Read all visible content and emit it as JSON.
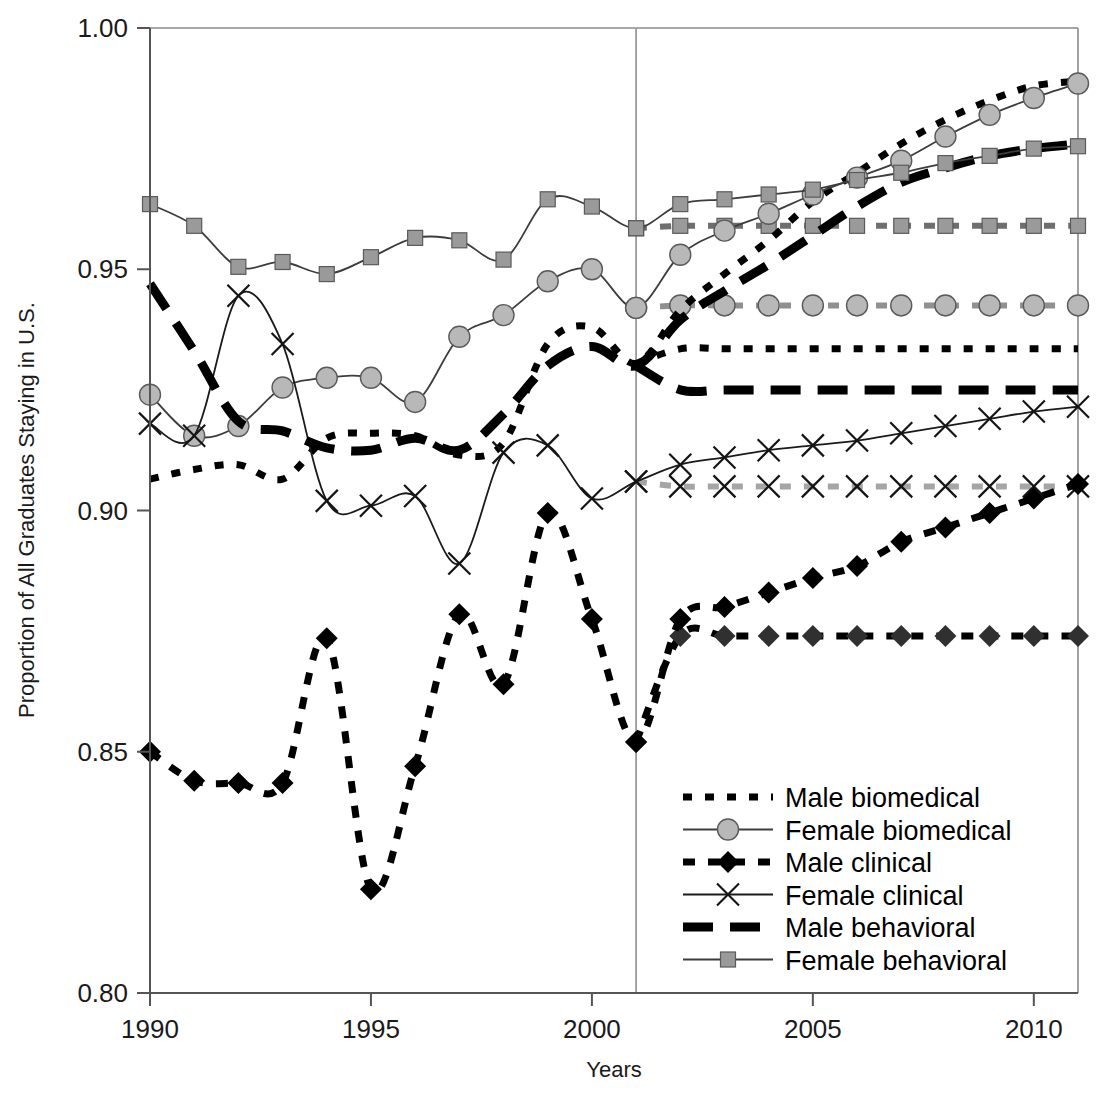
{
  "chart_data": {
    "type": "line",
    "title": "",
    "xlabel": "Years",
    "ylabel": "Proportion of All Graduates Staying in U.S.",
    "xlim": [
      1990,
      2011
    ],
    "ylim": [
      0.8,
      1.0
    ],
    "grid": false,
    "legend_position": "inside-bottom-right",
    "x_ticks": [
      1990,
      1995,
      2000,
      2005,
      2010
    ],
    "x_tick_labels": [
      "1990",
      "1995",
      "2000",
      "2005",
      "2010"
    ],
    "y_ticks": [
      0.8,
      0.85,
      0.9,
      0.95,
      1.0
    ],
    "y_tick_labels": [
      "0.80",
      "0.85",
      "0.90",
      "0.95",
      "1.00"
    ],
    "annotations": [
      {
        "type": "vertical-reference-line",
        "x": 2001,
        "label": ""
      }
    ],
    "x": [
      1990,
      1991,
      1992,
      1993,
      1994,
      1995,
      1996,
      1997,
      1998,
      1999,
      2000,
      2001,
      2002,
      2003,
      2004,
      2005,
      2006,
      2007,
      2008,
      2009,
      2010,
      2011
    ],
    "series": [
      {
        "name": "Male biomedical",
        "style": "dotted-thick-black",
        "color": "#000000",
        "marker": "none",
        "values": [
          0.9065,
          0.9085,
          0.9095,
          0.9065,
          0.915,
          0.916,
          0.9155,
          0.9115,
          0.914,
          0.9345,
          0.938,
          0.9305,
          0.9415,
          0.949,
          0.956,
          0.964,
          0.97,
          0.976,
          0.981,
          0.985,
          0.988,
          0.989
        ]
      },
      {
        "name": "Male biomedical (projected flat)",
        "style": "dotted-thick-black",
        "color": "#000000",
        "marker": "none",
        "is_projection_flat": true,
        "values": [
          null,
          null,
          null,
          null,
          null,
          null,
          null,
          null,
          null,
          null,
          null,
          0.9305,
          0.9335,
          0.9335,
          0.9335,
          0.9335,
          0.9335,
          0.9335,
          0.9335,
          0.9335,
          0.9335,
          0.9335
        ]
      },
      {
        "name": "Female biomedical",
        "style": "solid-thin-gray",
        "color": "#444444",
        "marker": "circle",
        "marker_fill": "#b8b8b8",
        "values": [
          0.924,
          0.9155,
          0.9175,
          0.9255,
          0.9275,
          0.9275,
          0.9225,
          0.936,
          0.9405,
          0.9475,
          0.95,
          0.942,
          0.953,
          0.958,
          0.9615,
          0.9655,
          0.969,
          0.9725,
          0.9775,
          0.982,
          0.9855,
          0.9885
        ]
      },
      {
        "name": "Female biomedical (projected flat)",
        "style": "dashed-gray-circle",
        "color": "#888888",
        "marker": "circle",
        "marker_fill": "#b8b8b8",
        "is_projection_flat": true,
        "values": [
          null,
          null,
          null,
          null,
          null,
          null,
          null,
          null,
          null,
          null,
          null,
          0.942,
          0.9425,
          0.9425,
          0.9425,
          0.9425,
          0.9425,
          0.9425,
          0.9425,
          0.9425,
          0.9425,
          0.9425
        ]
      },
      {
        "name": "Male clinical",
        "style": "dashed-thick-black-diamond",
        "color": "#000000",
        "marker": "diamond",
        "marker_fill": "#000000",
        "values": [
          0.85,
          0.844,
          0.8435,
          0.8435,
          0.8735,
          0.8215,
          0.847,
          0.8785,
          0.864,
          0.8995,
          0.8775,
          0.852,
          0.8775,
          0.88,
          0.883,
          0.886,
          0.8885,
          0.8935,
          0.8965,
          0.8995,
          0.9025,
          0.9055
        ]
      },
      {
        "name": "Male clinical (projected flat)",
        "style": "dashed-thick-black-diamond",
        "color": "#1a1a1a",
        "marker": "diamond",
        "marker_fill": "#303030",
        "is_projection_flat": true,
        "values": [
          null,
          null,
          null,
          null,
          null,
          null,
          null,
          null,
          null,
          null,
          null,
          0.852,
          0.874,
          0.874,
          0.874,
          0.874,
          0.874,
          0.874,
          0.874,
          0.874,
          0.874,
          0.874
        ]
      },
      {
        "name": "Female clinical",
        "style": "solid-thin-black-x",
        "color": "#1a1a1a",
        "marker": "x",
        "values": [
          0.918,
          0.9155,
          0.9445,
          0.9345,
          0.902,
          0.901,
          0.903,
          0.889,
          0.912,
          0.9135,
          0.9025,
          0.906,
          0.9095,
          0.911,
          0.9125,
          0.9135,
          0.9145,
          0.916,
          0.9175,
          0.919,
          0.9205,
          0.9215
        ]
      },
      {
        "name": "Female clinical (projected flat)",
        "style": "dashed-gray-x",
        "color": "#999999",
        "marker": "x",
        "is_projection_flat": true,
        "values": [
          null,
          null,
          null,
          null,
          null,
          null,
          null,
          null,
          null,
          null,
          null,
          0.906,
          0.905,
          0.905,
          0.905,
          0.905,
          0.905,
          0.905,
          0.905,
          0.905,
          0.905,
          0.905
        ]
      },
      {
        "name": "Male behavioral",
        "style": "longdash-thick-black",
        "color": "#000000",
        "marker": "none",
        "values": [
          0.947,
          0.933,
          0.9185,
          0.9165,
          0.913,
          0.9125,
          0.915,
          0.9125,
          0.92,
          0.93,
          0.934,
          0.93,
          0.9395,
          0.9455,
          0.951,
          0.957,
          0.963,
          0.968,
          0.971,
          0.9735,
          0.975,
          0.976
        ]
      },
      {
        "name": "Male behavioral (projected flat)",
        "style": "longdash-thick-black",
        "color": "#000000",
        "marker": "none",
        "is_projection_flat": true,
        "values": [
          null,
          null,
          null,
          null,
          null,
          null,
          null,
          null,
          null,
          null,
          null,
          0.93,
          0.925,
          0.925,
          0.925,
          0.925,
          0.925,
          0.925,
          0.925,
          0.925,
          0.925,
          0.925
        ]
      },
      {
        "name": "Female behavioral",
        "style": "solid-thin-gray-square",
        "color": "#444444",
        "marker": "square",
        "marker_fill": "#9a9a9a",
        "values": [
          0.9635,
          0.959,
          0.9505,
          0.9515,
          0.949,
          0.9525,
          0.9565,
          0.956,
          0.952,
          0.9645,
          0.963,
          0.9585,
          0.9635,
          0.9645,
          0.9655,
          0.9665,
          0.9685,
          0.97,
          0.972,
          0.9735,
          0.975,
          0.9755
        ]
      },
      {
        "name": "Female behavioral (projected flat)",
        "style": "dashed-gray-square",
        "color": "#4a4a4a",
        "marker": "square",
        "marker_fill": "#9a9a9a",
        "is_projection_flat": true,
        "values": [
          null,
          null,
          null,
          null,
          null,
          null,
          null,
          null,
          null,
          null,
          null,
          0.9585,
          0.959,
          0.959,
          0.959,
          0.959,
          0.959,
          0.959,
          0.959,
          0.959,
          0.959,
          0.959
        ]
      }
    ],
    "legend": [
      {
        "label": "Male biomedical",
        "style": "dotted-thick-black",
        "marker": "none"
      },
      {
        "label": "Female biomedical",
        "style": "solid-thin-gray",
        "marker": "circle"
      },
      {
        "label": "Male clinical",
        "style": "dashed-thick-black-diamond",
        "marker": "diamond"
      },
      {
        "label": "Female clinical",
        "style": "solid-thin-black-x",
        "marker": "x"
      },
      {
        "label": "Male behavioral",
        "style": "longdash-thick-black",
        "marker": "none"
      },
      {
        "label": "Female behavioral",
        "style": "solid-thin-gray-square",
        "marker": "square"
      }
    ]
  },
  "colors": {
    "axis": "#555555",
    "frame": "#8a8a8a",
    "marker_gray": "#b8b8b8",
    "marker_gray_square": "#9a9a9a",
    "black": "#000000",
    "reference_line": "#9a9a9a"
  }
}
